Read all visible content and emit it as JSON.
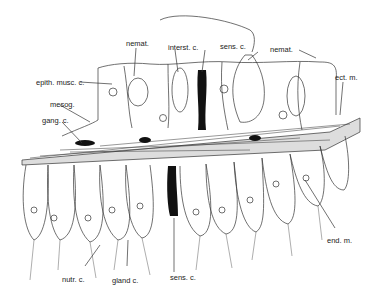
{
  "figure": {
    "labels": {
      "nemat_left": "nemat.",
      "interst": "interst. c.",
      "sens_top": "sens. c.",
      "nemat_right": "nemat.",
      "epith": "epith. musc. c.",
      "ect": "ect. m.",
      "mesog": "mesog.",
      "gang": "gang. c.",
      "end": "end. m.",
      "nutr": "nutr. c.",
      "gland": "gland c.",
      "sens_bottom": "sens. c."
    }
  }
}
